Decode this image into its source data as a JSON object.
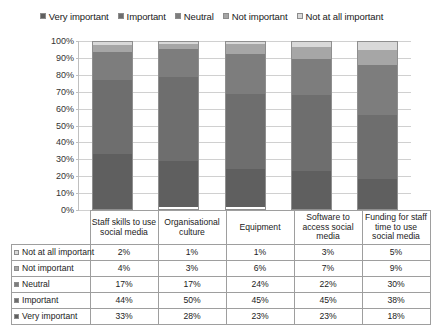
{
  "chart_data": {
    "type": "bar",
    "subtype": "stacked-100-percent-column",
    "title": "",
    "xlabel": "",
    "ylabel": "",
    "ylim": [
      0,
      100
    ],
    "ytick_labels": [
      "100%",
      "90%",
      "80%",
      "70%",
      "60%",
      "50%",
      "40%",
      "30%",
      "20%",
      "10%",
      "0%"
    ],
    "ytick_values": [
      100,
      90,
      80,
      70,
      60,
      50,
      40,
      30,
      20,
      10,
      0
    ],
    "grid": true,
    "legend_position": "top",
    "categories": [
      "Staff skills to use social media",
      "Organisational culture",
      "Equipment",
      "Software to access social media",
      "Funding for staff time to use social media"
    ],
    "series": [
      {
        "name": "Very important",
        "values": [
          33,
          28,
          23,
          23,
          18
        ],
        "color": "#5f5f5f"
      },
      {
        "name": "Important",
        "values": [
          44,
          50,
          45,
          45,
          38
        ],
        "color": "#6e6e6e"
      },
      {
        "name": "Neutral",
        "values": [
          17,
          17,
          24,
          22,
          30
        ],
        "color": "#7d7d7d"
      },
      {
        "name": "Not important",
        "values": [
          4,
          3,
          6,
          7,
          9
        ],
        "color": "#a6a6a6"
      },
      {
        "name": "Not at all important",
        "values": [
          2,
          1,
          1,
          3,
          5
        ],
        "color": "#d9d9d9"
      }
    ],
    "stack_order_top_to_bottom": [
      "Not at all important",
      "Not important",
      "Neutral",
      "Important",
      "Very important"
    ]
  },
  "legend": {
    "items": [
      {
        "label": "Very important",
        "color": "#5f5f5f"
      },
      {
        "label": "Important",
        "color": "#6e6e6e"
      },
      {
        "label": "Neutral",
        "color": "#7d7d7d"
      },
      {
        "label": "Not important",
        "color": "#a6a6a6"
      },
      {
        "label": "Not at all important",
        "color": "#d9d9d9"
      }
    ]
  },
  "table": {
    "column_headers": [
      "Staff skills to use social media",
      "Organisational culture",
      "Equipment",
      "Software to access social media",
      "Funding for staff time to use social media"
    ],
    "rows": [
      {
        "label": "Not at all important",
        "color": "#d9d9d9",
        "values": [
          "2%",
          "1%",
          "1%",
          "3%",
          "5%"
        ]
      },
      {
        "label": "Not important",
        "color": "#a6a6a6",
        "values": [
          "4%",
          "3%",
          "6%",
          "7%",
          "9%"
        ]
      },
      {
        "label": "Neutral",
        "color": "#7d7d7d",
        "values": [
          "17%",
          "17%",
          "24%",
          "22%",
          "30%"
        ]
      },
      {
        "label": "Important",
        "color": "#6e6e6e",
        "values": [
          "44%",
          "50%",
          "45%",
          "45%",
          "38%"
        ]
      },
      {
        "label": "Very important",
        "color": "#5f5f5f",
        "values": [
          "33%",
          "28%",
          "23%",
          "23%",
          "18%"
        ]
      }
    ]
  }
}
